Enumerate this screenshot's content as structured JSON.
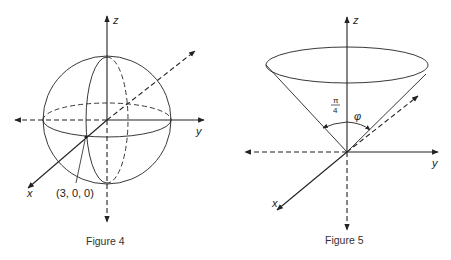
{
  "figure4": {
    "caption": "Figure 4",
    "axis_labels": {
      "x": "x",
      "y": "y",
      "z": "z"
    },
    "point_label": "(3, 0, 0)",
    "shape": "sphere"
  },
  "figure5": {
    "caption": "Figure 5",
    "axis_labels": {
      "x": "x",
      "y": "y",
      "z": "z"
    },
    "angle_label_num": "π",
    "angle_label_den": "4",
    "phi_label": "φ",
    "shape": "cone"
  },
  "colors": {
    "stroke": "#222222",
    "background": "#ffffff"
  }
}
